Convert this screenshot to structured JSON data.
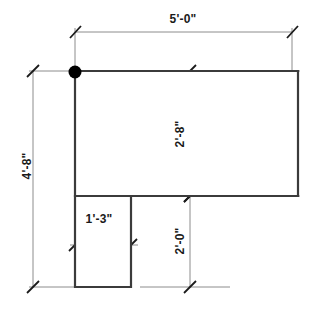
{
  "drawing": {
    "title": "L-shaped floor plan with dimensions",
    "units": "feet-inches",
    "colors": {
      "background": "#ffffff",
      "outline": "#3b3b3b",
      "dimension_line": "#8c8c8c",
      "tick": "#1a1a1a",
      "text": "#1a1a1a",
      "origin_marker": "#000000"
    },
    "origin_marker": {
      "name": "origin-point",
      "x": 75,
      "y": 72,
      "radius": 6
    },
    "shape": {
      "name": "l-shape-polygon",
      "points": "75,71 298,71 298,196 75,196",
      "notch": "75,196 131,196 131,287 75,287"
    },
    "dimensions": [
      {
        "id": "overall-width",
        "label": "5'-0\"",
        "orientation": "horizontal",
        "text_x": 183,
        "text_y": 19,
        "line_y": 32,
        "from_x": 75,
        "to_x": 292
      },
      {
        "id": "overall-height",
        "label": "4'-8\"",
        "orientation": "vertical",
        "text_x": 27,
        "text_y": 166,
        "line_x": 33,
        "from_y": 71,
        "to_y": 287
      },
      {
        "id": "upper-leg-depth",
        "label": "2'-8\"",
        "orientation": "vertical",
        "text_x": 180,
        "text_y": 134,
        "line_x": 190,
        "from_y": 71,
        "to_y": 196
      },
      {
        "id": "lower-leg-depth",
        "label": "2'-0\"",
        "orientation": "vertical",
        "text_x": 180,
        "text_y": 241,
        "line_x": 190,
        "from_y": 196,
        "to_y": 287
      },
      {
        "id": "notch-width",
        "label": "1'-3\"",
        "orientation": "horizontal",
        "text_x": 99,
        "text_y": 219,
        "line_y": 245,
        "from_x": 75,
        "to_x": 131
      }
    ]
  }
}
